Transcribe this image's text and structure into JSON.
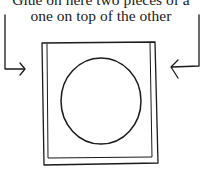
{
  "caption": {
    "line1": "Glue on here two pieces of a",
    "line2": "one on top of the other"
  },
  "colors": {
    "ink": "#1a1a1a",
    "paper": "#ffffff"
  },
  "shapes": {
    "outer_frame": "rectangle",
    "inner_frame": "rectangle",
    "center": "circle",
    "left_arrow": "arrow pointing right into frame",
    "right_arrow": "arrow pointing left into frame"
  }
}
